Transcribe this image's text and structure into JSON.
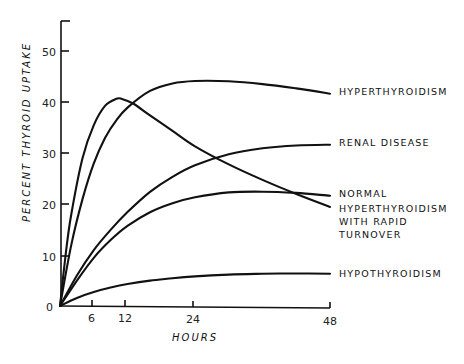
{
  "chart_data": {
    "type": "line",
    "title": "",
    "xlabel": "HOURS",
    "ylabel": "PERCENT THYROID UPTAKE",
    "xlim": [
      0,
      48
    ],
    "ylim": [
      0,
      55
    ],
    "x_ticks": [
      6,
      12,
      24,
      48
    ],
    "y_ticks": [
      0,
      10,
      20,
      30,
      40,
      50
    ],
    "grid": false,
    "legend": "inline labels at right end of each curve",
    "series": [
      {
        "name": "HYPERTHYROIDISM",
        "label_lines": [
          "HYPERTHYROIDISM"
        ],
        "x": [
          0,
          2,
          4,
          6,
          8,
          10,
          12,
          16,
          20,
          24,
          30,
          36,
          42,
          48
        ],
        "values": [
          0,
          12,
          21,
          28,
          33,
          36.5,
          39,
          42.3,
          43.8,
          44.3,
          44.3,
          43.8,
          43,
          42
        ]
      },
      {
        "name": "RENAL DISEASE",
        "label_lines": [
          "RENAL DISEASE"
        ],
        "x": [
          0,
          3,
          6,
          9,
          12,
          16,
          20,
          24,
          30,
          36,
          42,
          48
        ],
        "values": [
          0,
          6,
          11,
          15,
          18.5,
          22.5,
          25.5,
          27.8,
          30,
          31.2,
          31.8,
          32
        ]
      },
      {
        "name": "NORMAL",
        "label_lines": [
          "NORMAL"
        ],
        "x": [
          0,
          3,
          6,
          9,
          12,
          16,
          20,
          24,
          30,
          36,
          42,
          48
        ],
        "values": [
          0,
          5,
          9.5,
          13,
          15.8,
          18.5,
          20.3,
          21.5,
          22.5,
          22.7,
          22.5,
          22
        ]
      },
      {
        "name": "HYPERTHYROIDISM WITH RAPID TURNOVER",
        "label_lines": [
          "HYPERTHYROIDISM",
          "WITH RAPID",
          "TURNOVER"
        ],
        "x": [
          0,
          1,
          2,
          4,
          6,
          8,
          10,
          11,
          13,
          16,
          20,
          24,
          30,
          36,
          42,
          48
        ],
        "values": [
          0,
          10,
          18,
          29,
          35.5,
          39.3,
          40.7,
          40.7,
          39.8,
          37.5,
          34.5,
          31.5,
          28,
          25,
          22.3,
          19.8
        ]
      },
      {
        "name": "HYPOTHYROIDISM",
        "label_lines": [
          "HYPOTHYROIDISM"
        ],
        "x": [
          0,
          3,
          6,
          9,
          12,
          16,
          20,
          24,
          30,
          36,
          42,
          48
        ],
        "values": [
          0,
          1.6,
          2.8,
          3.7,
          4.4,
          5.1,
          5.6,
          6,
          6.4,
          6.6,
          6.7,
          6.7
        ]
      }
    ]
  },
  "axes": {
    "x_title": "HOURS",
    "y_title": "PERCENT THYROID UPTAKE",
    "x_tick_labels": [
      "6",
      "12",
      "24",
      "48"
    ],
    "y_tick_labels": [
      "0",
      "10",
      "20",
      "30",
      "40",
      "50"
    ]
  },
  "labels": {
    "hyper": "HYPERTHYROIDISM",
    "renal": "RENAL DISEASE",
    "normal": "NORMAL",
    "rapid_1": "HYPERTHYROIDISM",
    "rapid_2": "WITH RAPID",
    "rapid_3": "TURNOVER",
    "hypo": "HYPOTHYROIDISM"
  }
}
